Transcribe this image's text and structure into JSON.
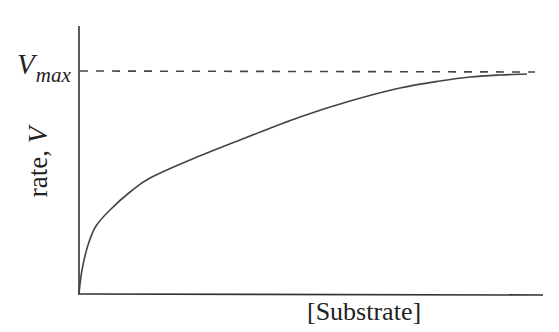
{
  "chart_data": {
    "type": "line",
    "title": "",
    "xlabel": "[Substrate]",
    "ylabel": "rate, V",
    "ylabel_prefix": "rate, ",
    "ylabel_var": "V",
    "annotations": [
      {
        "text": "Vmax",
        "main": "V",
        "subscript": "max",
        "type": "horizontal-dashed-asymptote",
        "y": 1.0
      }
    ],
    "grid": false,
    "legend": null,
    "x_ticks": [],
    "y_ticks": [],
    "xlim": [
      0,
      1
    ],
    "ylim": [
      0,
      1.1
    ],
    "series": [
      {
        "name": "Michaelis-Menten saturation curve",
        "x": [
          0.0,
          0.02,
          0.07,
          0.16,
          0.25,
          0.49,
          0.7,
          0.86,
          0.99
        ],
        "y": [
          0.0,
          0.33,
          0.5,
          0.62,
          0.74,
          0.86,
          0.94,
          0.98,
          0.99
        ]
      }
    ],
    "asymptote": {
      "name": "Vmax",
      "y": 1.0,
      "style": "dashed"
    }
  },
  "colors": {
    "axis": "#333333",
    "curve": "#444444",
    "dash": "#444444",
    "background": "#ffffff"
  },
  "geometry": {
    "origin": [
      79,
      293
    ],
    "y_axis_top": 26,
    "x_axis_end": 543,
    "vmax_y": 71,
    "dash_end": 535,
    "curve_points": [
      [
        79,
        293
      ],
      [
        82,
        270
      ],
      [
        88,
        245
      ],
      [
        96,
        226
      ],
      [
        110,
        210
      ],
      [
        130,
        192
      ],
      [
        150,
        178
      ],
      [
        190,
        160
      ],
      [
        240,
        140
      ],
      [
        300,
        117
      ],
      [
        350,
        101
      ],
      [
        400,
        88
      ],
      [
        440,
        81
      ],
      [
        470,
        77
      ],
      [
        500,
        75
      ],
      [
        527,
        74
      ]
    ]
  }
}
